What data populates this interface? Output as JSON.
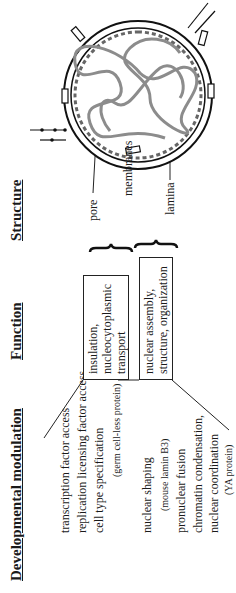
{
  "headers": {
    "developmental": "Developmental modulation",
    "function": "Function",
    "structure": "Structure"
  },
  "developmental_modulation": {
    "group1": [
      "transcription factor access",
      "replication licensing factor access",
      "cell type specification",
      "(germ cell-less protein)"
    ],
    "group2": [
      "nuclear shaping",
      "(mouse lamin B3)",
      "pronuclear fusion",
      "chromatin condensation,",
      "nuclear coordination",
      "(YA protein)"
    ]
  },
  "functions": [
    {
      "lines": [
        "insulation,",
        "nucleocytoplasmic",
        "transport"
      ]
    },
    {
      "lines": [
        "nuclear assembly,",
        "structure, organization"
      ]
    }
  ],
  "structure_labels": {
    "pore": "pore",
    "membranes": "membranes",
    "lamina": "lamina"
  },
  "colors": {
    "ink": "#1a1a1a",
    "chromatin": "#8c8c8c",
    "background": "#ffffff"
  }
}
